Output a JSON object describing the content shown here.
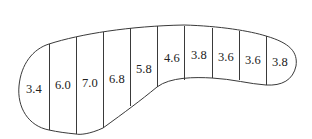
{
  "diagram": {
    "type": "cross-section with measured widths",
    "outline_color": "#3a3a3a",
    "text_color": "#222222",
    "segments": [
      {
        "label": "3.4",
        "x": 26,
        "y": 93
      },
      {
        "label": "6.0",
        "x": 55,
        "y": 89
      },
      {
        "label": "7.0",
        "x": 82,
        "y": 87
      },
      {
        "label": "6.8",
        "x": 109,
        "y": 83
      },
      {
        "label": "5.8",
        "x": 136,
        "y": 73
      },
      {
        "label": "4.6",
        "x": 164,
        "y": 62
      },
      {
        "label": "3.8",
        "x": 191,
        "y": 59
      },
      {
        "label": "3.6",
        "x": 218,
        "y": 61
      },
      {
        "label": "3.6",
        "x": 245,
        "y": 64
      },
      {
        "label": "3.8",
        "x": 272,
        "y": 66
      }
    ],
    "dividers": [
      {
        "x": 49,
        "y1": 44,
        "y2": 130
      },
      {
        "x": 76,
        "y1": 37,
        "y2": 134
      },
      {
        "x": 103,
        "y1": 32,
        "y2": 128
      },
      {
        "x": 130,
        "y1": 28,
        "y2": 106
      },
      {
        "x": 157,
        "y1": 26,
        "y2": 87
      },
      {
        "x": 184,
        "y1": 26,
        "y2": 80
      },
      {
        "x": 212,
        "y1": 28,
        "y2": 78
      },
      {
        "x": 239,
        "y1": 31,
        "y2": 80
      },
      {
        "x": 266,
        "y1": 36,
        "y2": 85
      }
    ]
  }
}
